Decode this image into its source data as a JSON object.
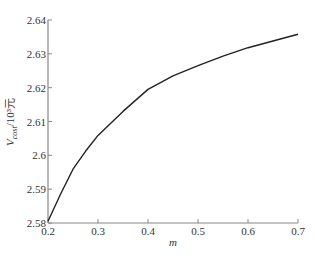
{
  "chart_data": {
    "type": "line",
    "title": "",
    "xlabel": "m",
    "ylabel": "V_cost/10³元",
    "ylabel_parts": {
      "main": "V",
      "sub": "cost",
      "rest": "/10³元"
    },
    "xlim": [
      0.2,
      0.7
    ],
    "ylim": [
      2.58,
      2.64
    ],
    "x_ticks": [
      0.2,
      0.3,
      0.4,
      0.5,
      0.6,
      0.7
    ],
    "x_tick_labels": [
      "0.2",
      "0.3",
      "0.4",
      "0.5",
      "0.6",
      "0.7"
    ],
    "y_ticks": [
      2.58,
      2.59,
      2.6,
      2.61,
      2.62,
      2.63,
      2.64
    ],
    "y_tick_labels": [
      "2.58",
      "2.59",
      "2.6",
      "2.61",
      "2.62",
      "2.63",
      "2.64"
    ],
    "grid": false,
    "legend": null,
    "series": [
      {
        "name": "V_cost",
        "color": "#222222",
        "x": [
          0.2,
          0.225,
          0.25,
          0.275,
          0.3,
          0.35,
          0.4,
          0.45,
          0.5,
          0.55,
          0.6,
          0.65,
          0.7
        ],
        "values": [
          2.5805,
          2.5885,
          2.5959,
          2.6012,
          2.6059,
          2.613,
          2.6195,
          2.6235,
          2.6265,
          2.6293,
          2.6318,
          2.6338,
          2.6358
        ]
      }
    ]
  }
}
